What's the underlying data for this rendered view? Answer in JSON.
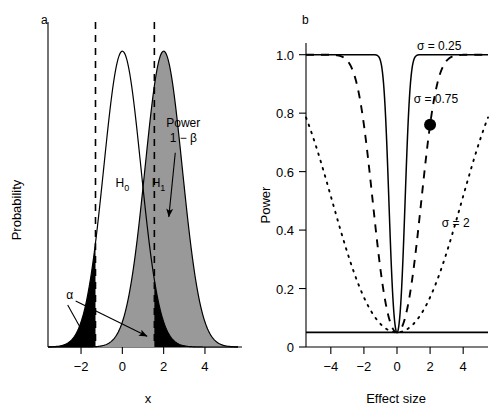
{
  "figure": {
    "background": "#ffffff",
    "ink_color": "#000000",
    "fill_gray": "#999999",
    "fill_black": "#000000"
  },
  "chart_data": [
    {
      "type": "area",
      "panel_label": "a",
      "title": "",
      "xlabel": "x",
      "ylabel": "Probability",
      "xlim": [
        -3.6,
        5.6
      ],
      "ylim": [
        0,
        0.46
      ],
      "xticks": [
        -2,
        0,
        2,
        4
      ],
      "xtick_labels": [
        "−2",
        "0",
        "2",
        "4"
      ],
      "yticks": [],
      "ytick_labels": [],
      "grid": false,
      "legend_position": "inline-annotations",
      "series": [
        {
          "name": "H0",
          "label": "H",
          "label_sub": "0",
          "distribution": "normal",
          "mean": 0,
          "sd": 0.9,
          "peak_height": 0.443,
          "fill": "none",
          "stroke": "#000000",
          "label_x": 0,
          "label_y": 0.52
        },
        {
          "name": "H1",
          "label": "H",
          "label_sub": "1",
          "distribution": "normal",
          "mean": 2,
          "sd": 0.9,
          "peak_height": 0.443,
          "fill": "#999999",
          "stroke": "#000000",
          "label_x": 1.75,
          "label_y": 0.52
        }
      ],
      "critical_values": [
        -1.3,
        1.55
      ],
      "rejection_regions": [
        {
          "name": "left-tail",
          "from": -3.6,
          "to": -1.3,
          "fill": "#000000"
        },
        {
          "name": "right-tail",
          "from": 1.55,
          "to": 5.6,
          "fill": "#000000"
        }
      ],
      "annotations": [
        {
          "name": "power-annotation",
          "line1": "Power",
          "line2": "1 − β",
          "text_x": 2.95,
          "text_y": 0.33,
          "arrow_to_x": 2.25,
          "arrow_to_y": 0.195
        },
        {
          "name": "alpha-annotation",
          "text": "α",
          "text_x": -2.55,
          "text_y": 0.072,
          "arrow1_to_x": -1.75,
          "arrow1_to_y": 0.013,
          "arrow2_to_x": 1.2,
          "arrow2_to_y": 0.016
        }
      ]
    },
    {
      "type": "line",
      "panel_label": "b",
      "title": "",
      "xlabel": "Effect size",
      "ylabel": "Power",
      "xlim": [
        -5.5,
        5.5
      ],
      "ylim": [
        0,
        1.04
      ],
      "xticks": [
        -4,
        -2,
        0,
        2,
        4
      ],
      "xtick_labels": [
        "−4",
        "−2",
        "0",
        "2",
        "4"
      ],
      "yticks": [
        0,
        0.2,
        0.4,
        0.6,
        0.8,
        1.0
      ],
      "ytick_labels": [
        "0",
        "0.2",
        "0.4",
        "0.6",
        "0.8",
        "1.0"
      ],
      "grid": false,
      "alpha_level": 0.05,
      "legend_position": "inline-labels",
      "series": [
        {
          "name": "sigma-0.25",
          "label": "σ = 0.25",
          "sigma": 0.25,
          "style": "solid",
          "label_x": 2.55,
          "label_y": 1.015,
          "values_note": "two-sided power for n-based SE sigma=0.25; reaches 1.0 by |effect| ~ 0.9"
        },
        {
          "name": "sigma-0.75",
          "label": "σ = 0.75",
          "sigma": 0.75,
          "style": "dashed",
          "label_x": 2.35,
          "label_y": 0.835,
          "values_note": "reaches 1.0 by |effect| ~ 2.8"
        },
        {
          "name": "sigma-2",
          "label": "σ = 2",
          "sigma": 2,
          "style": "dotted",
          "label_x": 3.55,
          "label_y": 0.41,
          "values_note": "power ~0.75 at |effect| = 5.5"
        }
      ],
      "markers": [
        {
          "name": "highlight-point",
          "x": 2,
          "y": 0.76,
          "fill": "#000000",
          "radius": 6,
          "on_series": "sigma-0.75"
        }
      ]
    }
  ]
}
